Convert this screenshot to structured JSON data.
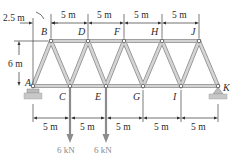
{
  "figure": {
    "type": "warren-truss",
    "joints": {
      "A": {
        "label": "A",
        "x": 33,
        "y": 86
      },
      "B": {
        "label": "B",
        "x": 51,
        "y": 41
      },
      "C": {
        "label": "C",
        "x": 70,
        "y": 86
      },
      "D": {
        "label": "D",
        "x": 88,
        "y": 41
      },
      "E": {
        "label": "E",
        "x": 106,
        "y": 86
      },
      "F": {
        "label": "F",
        "x": 124,
        "y": 41
      },
      "G": {
        "label": "G",
        "x": 143,
        "y": 86
      },
      "H": {
        "label": "H",
        "x": 162,
        "y": 41
      },
      "I": {
        "label": "I",
        "x": 181,
        "y": 86
      },
      "J": {
        "label": "J",
        "x": 199,
        "y": 41
      },
      "K": {
        "label": "K",
        "x": 218,
        "y": 86
      }
    },
    "members": [
      [
        "A",
        "C"
      ],
      [
        "C",
        "E"
      ],
      [
        "E",
        "G"
      ],
      [
        "G",
        "I"
      ],
      [
        "I",
        "K"
      ],
      [
        "B",
        "D"
      ],
      [
        "D",
        "F"
      ],
      [
        "F",
        "H"
      ],
      [
        "H",
        "J"
      ],
      [
        "A",
        "B"
      ],
      [
        "B",
        "C"
      ],
      [
        "C",
        "D"
      ],
      [
        "D",
        "E"
      ],
      [
        "E",
        "F"
      ],
      [
        "F",
        "G"
      ],
      [
        "G",
        "H"
      ],
      [
        "H",
        "I"
      ],
      [
        "I",
        "J"
      ],
      [
        "J",
        "K"
      ]
    ],
    "dimensions": {
      "offset_top": "2.5 m",
      "top_spacing": [
        "5 m",
        "5 m",
        "5 m",
        "5 m"
      ],
      "height": "6 m",
      "bottom_spacing": [
        "5 m",
        "5 m",
        "5 m",
        "5 m",
        "5 m"
      ]
    },
    "loads": [
      {
        "joint": "C",
        "label": "6 kN"
      },
      {
        "joint": "E",
        "label": "6 kN"
      }
    ],
    "supports": {
      "A": "roller",
      "K": "pin"
    },
    "colors": {
      "member": "#d4d4d4",
      "member_edge": "#8f8f8f",
      "load": "#8c8c8c",
      "text": "#2a2a2a"
    }
  }
}
